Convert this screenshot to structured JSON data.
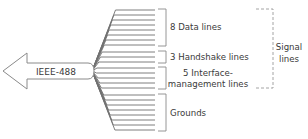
{
  "diagram": {
    "connector_label": "IEEE-488",
    "groups": [
      {
        "id": "data",
        "label_lines": [
          "8 Data lines"
        ],
        "count": 8
      },
      {
        "id": "handshake",
        "label_lines": [
          "3 Handshake lines"
        ],
        "count": 3
      },
      {
        "id": "interface",
        "label_lines": [
          "5 Interface-",
          "management lines"
        ],
        "count": 5
      },
      {
        "id": "grounds",
        "label_lines": [
          "Grounds"
        ],
        "count": 8
      }
    ],
    "signal_bracket_label": [
      "Signal",
      "lines"
    ],
    "colors": {
      "line": "#707070",
      "outline": "#8a8a8a",
      "text": "#3a3a3a",
      "dashed": "#9a9a9a"
    }
  }
}
